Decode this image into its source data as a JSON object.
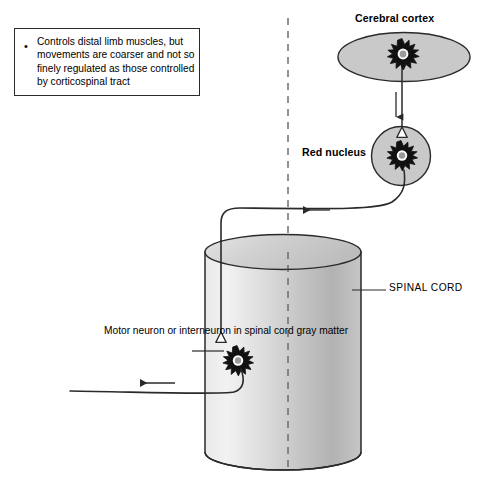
{
  "figure": {
    "callout": {
      "bullet_glyph": "•",
      "text": "Controls distal limb muscles, but movements are coarser and not so finely regulated as those controlled by corticospinal tract"
    },
    "labels": {
      "cerebral_cortex": "Cerebral cortex",
      "red_nucleus": "Red nucleus",
      "spinal_cord": "SPINAL CORD",
      "motor_neuron": "Motor neuron or interneuron in spinal cord gray matter"
    },
    "caption": "",
    "colors": {
      "stroke": "#2a2a2a",
      "structure_fill": "#c9c9c9",
      "cylinder_light": "#efefef",
      "cylinder_mid": "#d2d2d2",
      "cylinder_dark": "#a8a8a8",
      "neuron_nucleus": "#9a9a9a",
      "background": "#ffffff"
    },
    "parts": [
      {
        "name": "cerebral-cortex-ellipse",
        "shape": "ellipse"
      },
      {
        "name": "cortex-neuron",
        "shape": "star-neuron"
      },
      {
        "name": "descending-axon-arrow",
        "shape": "arrow-down"
      },
      {
        "name": "red-nucleus-circle",
        "shape": "circle"
      },
      {
        "name": "red-nucleus-neuron",
        "shape": "star-neuron"
      },
      {
        "name": "cortex-to-red-nucleus-synapse",
        "shape": "triangle-terminal"
      },
      {
        "name": "rubrospinal-tract",
        "shape": "path"
      },
      {
        "name": "tract-direction-arrow",
        "shape": "arrow-left"
      },
      {
        "name": "spinal-cord-cylinder",
        "shape": "cylinder"
      },
      {
        "name": "midline-dashed",
        "shape": "dashed-line"
      },
      {
        "name": "spinal-neuron",
        "shape": "star-neuron"
      },
      {
        "name": "tract-to-spinal-neuron-synapse",
        "shape": "triangle-terminal"
      },
      {
        "name": "motor-axon-out",
        "shape": "path"
      },
      {
        "name": "motor-axon-arrow",
        "shape": "arrow-left"
      },
      {
        "name": "spinal-cord-leader-line",
        "shape": "line"
      },
      {
        "name": "motor-neuron-leader-line",
        "shape": "line"
      }
    ]
  }
}
